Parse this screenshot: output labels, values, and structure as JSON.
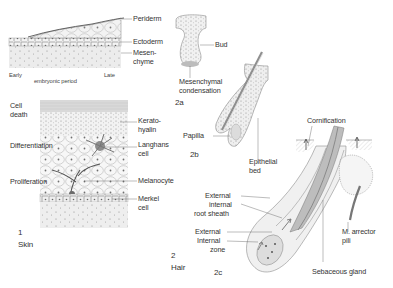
{
  "figure": {
    "panel_1": {
      "number": "1",
      "title": "Skin",
      "embryonic": {
        "labels": {
          "periderm": "Periderm",
          "ectoderm": "Ectoderm",
          "mesenchyme_1": "Mesen-",
          "mesenchyme_2": "chyme"
        },
        "timeline": {
          "early": "Early",
          "period": "embryonic period",
          "late": "Late"
        }
      },
      "adult": {
        "left_labels": {
          "cell_death_1": "Cell",
          "cell_death_2": "death",
          "differentiation": "Differentiation",
          "proliferation": "Proliferation"
        },
        "right_labels": {
          "keratohyalin_1": "Kerato-",
          "keratohyalin_2": "hyalin",
          "langhans_1": "Langhans",
          "langhans_2": "cell",
          "melanocyte": "Melanocyte",
          "merkel_1": "Merkel",
          "merkel_2": "cell"
        }
      }
    },
    "panel_2": {
      "number": "2",
      "title": "Hair",
      "sub_2a": {
        "tag": "2a",
        "bud": "Bud",
        "mesenchymal_1": "Mesenchymal",
        "mesenchymal_2": "condensation"
      },
      "sub_2b": {
        "tag": "2b",
        "papilla": "Papilla",
        "epithelial_1": "Epithelial",
        "epithelial_2": "bed"
      },
      "sub_2c": {
        "tag": "2c",
        "cornification": "Cornification",
        "external_root_1": "External",
        "external_root_2": "internal",
        "external_root_3": "root sheath",
        "zone_1": "External",
        "zone_2": "Internal",
        "zone_3": "zone",
        "arrector_1": "M. arrector",
        "arrector_2": "pili",
        "sebaceous": "Sebaceous gland"
      }
    }
  }
}
